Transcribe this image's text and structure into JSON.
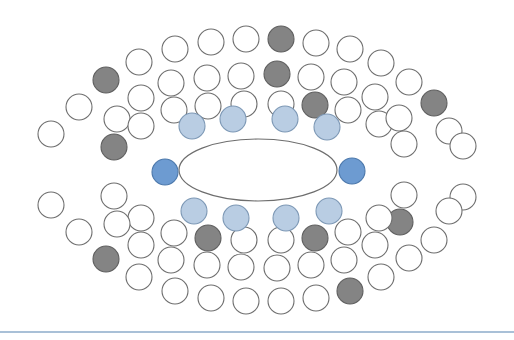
{
  "page": {
    "background": "#ffffff",
    "width": 514,
    "height": 340
  },
  "palette": {
    "white_fill": "#ffffff",
    "circle_stroke": "#6e6e6e",
    "gray_fill": "#848484",
    "gray_stroke": "#5f5f5f",
    "light_blue_fill": "#b9cde3",
    "light_blue_stroke": "#7d98b5",
    "dark_blue_fill": "#6d9bd1",
    "dark_blue_stroke": "#4c78ab",
    "ellipse_stroke": "#6e6e6e",
    "divider": "#a9c0d7"
  },
  "center_ellipse": {
    "name": "central-ellipse",
    "cx": 258,
    "cy": 170,
    "rx": 79,
    "ry": 31,
    "fill": "#ffffff",
    "stroke": "#6e6e6e",
    "stroke_width": 1.2
  },
  "divider": {
    "name": "bottom-divider",
    "y": 331,
    "color": "#a9c0d7",
    "thickness": 2
  },
  "rings": [
    {
      "id": "ring-inner",
      "label": "Inner Ring",
      "radius": 13,
      "circles": [
        {
          "cx": 165,
          "cy": 172,
          "color": "dark_blue",
          "label": "inner-left"
        },
        {
          "cx": 192,
          "cy": 126,
          "color": "light_blue",
          "label": "inner-top-1"
        },
        {
          "cx": 233,
          "cy": 119,
          "color": "light_blue",
          "label": "inner-top-2"
        },
        {
          "cx": 285,
          "cy": 119,
          "color": "light_blue",
          "label": "inner-top-3"
        },
        {
          "cx": 327,
          "cy": 127,
          "color": "light_blue",
          "label": "inner-top-4"
        },
        {
          "cx": 352,
          "cy": 171,
          "color": "dark_blue",
          "label": "inner-right"
        },
        {
          "cx": 329,
          "cy": 211,
          "color": "light_blue",
          "label": "inner-bottom-4"
        },
        {
          "cx": 286,
          "cy": 218,
          "color": "light_blue",
          "label": "inner-bottom-3"
        },
        {
          "cx": 236,
          "cy": 218,
          "color": "light_blue",
          "label": "inner-bottom-2"
        },
        {
          "cx": 194,
          "cy": 211,
          "color": "light_blue",
          "label": "inner-bottom-1"
        }
      ]
    },
    {
      "id": "ring-middle",
      "label": "Middle Ring",
      "radius": 13,
      "circles": [
        {
          "cx": 114,
          "cy": 147,
          "color": "gray",
          "label": "mid-1"
        },
        {
          "cx": 117,
          "cy": 119,
          "color": "white",
          "label": "mid-2"
        },
        {
          "cx": 141,
          "cy": 98,
          "color": "white",
          "label": "mid-3"
        },
        {
          "cx": 141,
          "cy": 126,
          "color": "white",
          "label": "mid-4"
        },
        {
          "cx": 171,
          "cy": 83,
          "color": "white",
          "label": "mid-5"
        },
        {
          "cx": 174,
          "cy": 110,
          "color": "white",
          "label": "mid-6"
        },
        {
          "cx": 207,
          "cy": 78,
          "color": "white",
          "label": "mid-7"
        },
        {
          "cx": 208,
          "cy": 106,
          "color": "white",
          "label": "mid-8"
        },
        {
          "cx": 241,
          "cy": 76,
          "color": "white",
          "label": "mid-9"
        },
        {
          "cx": 244,
          "cy": 104,
          "color": "white",
          "label": "mid-10"
        },
        {
          "cx": 277,
          "cy": 74,
          "color": "gray",
          "label": "mid-11"
        },
        {
          "cx": 281,
          "cy": 104,
          "color": "white",
          "label": "mid-12"
        },
        {
          "cx": 311,
          "cy": 77,
          "color": "white",
          "label": "mid-13"
        },
        {
          "cx": 315,
          "cy": 105,
          "color": "gray",
          "label": "mid-14"
        },
        {
          "cx": 344,
          "cy": 82,
          "color": "white",
          "label": "mid-15"
        },
        {
          "cx": 348,
          "cy": 110,
          "color": "white",
          "label": "mid-16"
        },
        {
          "cx": 375,
          "cy": 97,
          "color": "white",
          "label": "mid-17"
        },
        {
          "cx": 379,
          "cy": 124,
          "color": "white",
          "label": "mid-18"
        },
        {
          "cx": 399,
          "cy": 118,
          "color": "white",
          "label": "mid-19"
        },
        {
          "cx": 404,
          "cy": 144,
          "color": "white",
          "label": "mid-20"
        },
        {
          "cx": 404,
          "cy": 195,
          "color": "white",
          "label": "mid-21"
        },
        {
          "cx": 400,
          "cy": 222,
          "color": "gray",
          "label": "mid-22"
        },
        {
          "cx": 379,
          "cy": 218,
          "color": "white",
          "label": "mid-23"
        },
        {
          "cx": 375,
          "cy": 245,
          "color": "white",
          "label": "mid-24"
        },
        {
          "cx": 348,
          "cy": 232,
          "color": "white",
          "label": "mid-25"
        },
        {
          "cx": 344,
          "cy": 260,
          "color": "white",
          "label": "mid-26"
        },
        {
          "cx": 315,
          "cy": 238,
          "color": "gray",
          "label": "mid-27"
        },
        {
          "cx": 311,
          "cy": 265,
          "color": "white",
          "label": "mid-28"
        },
        {
          "cx": 281,
          "cy": 240,
          "color": "white",
          "label": "mid-29"
        },
        {
          "cx": 277,
          "cy": 268,
          "color": "white",
          "label": "mid-30"
        },
        {
          "cx": 244,
          "cy": 240,
          "color": "white",
          "label": "mid-31"
        },
        {
          "cx": 241,
          "cy": 267,
          "color": "white",
          "label": "mid-32"
        },
        {
          "cx": 208,
          "cy": 238,
          "color": "gray",
          "label": "mid-33"
        },
        {
          "cx": 207,
          "cy": 265,
          "color": "white",
          "label": "mid-34"
        },
        {
          "cx": 174,
          "cy": 233,
          "color": "white",
          "label": "mid-35"
        },
        {
          "cx": 171,
          "cy": 260,
          "color": "white",
          "label": "mid-36"
        },
        {
          "cx": 141,
          "cy": 218,
          "color": "white",
          "label": "mid-37"
        },
        {
          "cx": 141,
          "cy": 245,
          "color": "white",
          "label": "mid-38"
        },
        {
          "cx": 117,
          "cy": 224,
          "color": "white",
          "label": "mid-39"
        },
        {
          "cx": 114,
          "cy": 196,
          "color": "white",
          "label": "mid-40"
        }
      ]
    },
    {
      "id": "ring-outer",
      "label": "Outer Ring",
      "radius": 13,
      "circles": [
        {
          "cx": 51,
          "cy": 134,
          "color": "white",
          "label": "out-1"
        },
        {
          "cx": 79,
          "cy": 107,
          "color": "white",
          "label": "out-2"
        },
        {
          "cx": 106,
          "cy": 80,
          "color": "gray",
          "label": "out-3"
        },
        {
          "cx": 139,
          "cy": 62,
          "color": "white",
          "label": "out-4"
        },
        {
          "cx": 175,
          "cy": 49,
          "color": "white",
          "label": "out-5"
        },
        {
          "cx": 211,
          "cy": 42,
          "color": "white",
          "label": "out-6"
        },
        {
          "cx": 246,
          "cy": 39,
          "color": "white",
          "label": "out-7"
        },
        {
          "cx": 281,
          "cy": 39,
          "color": "gray",
          "label": "out-8"
        },
        {
          "cx": 316,
          "cy": 43,
          "color": "white",
          "label": "out-9"
        },
        {
          "cx": 350,
          "cy": 49,
          "color": "white",
          "label": "out-10"
        },
        {
          "cx": 381,
          "cy": 63,
          "color": "white",
          "label": "out-11"
        },
        {
          "cx": 409,
          "cy": 82,
          "color": "white",
          "label": "out-12"
        },
        {
          "cx": 434,
          "cy": 103,
          "color": "gray",
          "label": "out-13"
        },
        {
          "cx": 449,
          "cy": 131,
          "color": "white",
          "label": "out-14"
        },
        {
          "cx": 463,
          "cy": 146,
          "color": "white",
          "label": "out-15"
        },
        {
          "cx": 463,
          "cy": 197,
          "color": "white",
          "label": "out-16"
        },
        {
          "cx": 449,
          "cy": 211,
          "color": "white",
          "label": "out-17"
        },
        {
          "cx": 434,
          "cy": 240,
          "color": "white",
          "label": "out-18"
        },
        {
          "cx": 409,
          "cy": 258,
          "color": "white",
          "label": "out-19"
        },
        {
          "cx": 381,
          "cy": 277,
          "color": "white",
          "label": "out-20"
        },
        {
          "cx": 350,
          "cy": 291,
          "color": "gray",
          "label": "out-21"
        },
        {
          "cx": 316,
          "cy": 298,
          "color": "white",
          "label": "out-22"
        },
        {
          "cx": 281,
          "cy": 301,
          "color": "white",
          "label": "out-23"
        },
        {
          "cx": 246,
          "cy": 301,
          "color": "white",
          "label": "out-24"
        },
        {
          "cx": 211,
          "cy": 298,
          "color": "white",
          "label": "out-25"
        },
        {
          "cx": 175,
          "cy": 291,
          "color": "white",
          "label": "out-26"
        },
        {
          "cx": 139,
          "cy": 277,
          "color": "white",
          "label": "out-27"
        },
        {
          "cx": 106,
          "cy": 259,
          "color": "gray",
          "label": "out-28"
        },
        {
          "cx": 79,
          "cy": 232,
          "color": "white",
          "label": "out-29"
        },
        {
          "cx": 51,
          "cy": 205,
          "color": "white",
          "label": "out-30"
        }
      ]
    }
  ],
  "chart_data": {
    "type": "scatter",
    "counts": {
      "inner_ring": 10,
      "middle_ring": 40,
      "outer_ring": 30,
      "total": 80,
      "dark_blue": 2,
      "light_blue": 8,
      "gray": 11,
      "white": 59
    },
    "legend": [],
    "xlabel": "",
    "ylabel": "",
    "grid": false
  }
}
